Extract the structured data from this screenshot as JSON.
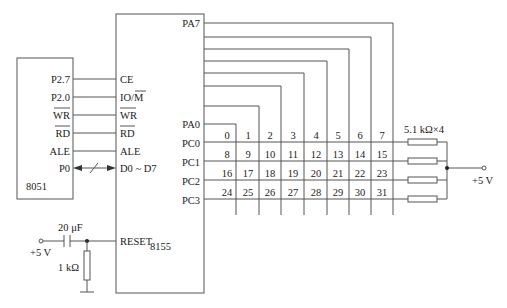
{
  "chips": {
    "mcu": {
      "name": "8051",
      "pins": [
        "P2.7",
        "P2.0",
        "WR",
        "RD",
        "ALE",
        "P0"
      ],
      "overlined": [
        false,
        false,
        true,
        true,
        false,
        false
      ]
    },
    "io": {
      "name": "8155",
      "left_pins": [
        "CE",
        "IO/M",
        "WR",
        "RD",
        "ALE",
        "D0 ~ D7",
        "RESET"
      ],
      "port_a_top": "PA7",
      "port_a_bottom": "PA0",
      "port_c": [
        "PC0",
        "PC1",
        "PC2",
        "PC3"
      ]
    }
  },
  "keypad": {
    "columns": 8,
    "rows": 4,
    "keys": [
      [
        "0",
        "1",
        "2",
        "3",
        "4",
        "5",
        "6",
        "7"
      ],
      [
        "8",
        "9",
        "10",
        "11",
        "12",
        "13",
        "14",
        "15"
      ],
      [
        "16",
        "17",
        "18",
        "19",
        "20",
        "21",
        "22",
        "23"
      ],
      [
        "24",
        "25",
        "26",
        "27",
        "28",
        "29",
        "30",
        "31"
      ]
    ]
  },
  "pullups": {
    "label": "5.1 kΩ×4",
    "supply": "+5 V"
  },
  "reset_circuit": {
    "capacitor": "20 μF",
    "resistor": "1 kΩ",
    "supply": "+5 V"
  }
}
